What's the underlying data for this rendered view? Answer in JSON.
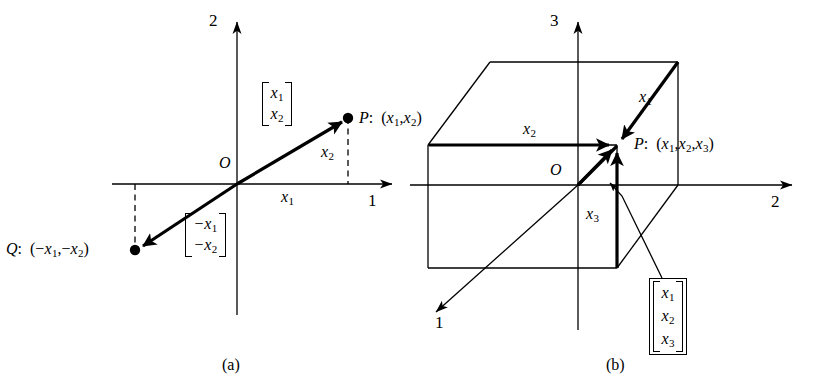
{
  "figure": {
    "type": "diagram",
    "panels": [
      {
        "id": "a",
        "caption": "(a)",
        "dimension": 2,
        "axes": [
          {
            "name": "axis-1",
            "label": "1",
            "direction": "right",
            "component_label": "x1"
          },
          {
            "name": "axis-2",
            "label": "2",
            "direction": "up",
            "component_label": "x2"
          }
        ],
        "origin_label": "O",
        "points": [
          {
            "name": "P",
            "label": "P:  (x₁, x₂)",
            "label_parts": {
              "name": "P",
              "sep": ":",
              "coords": "(x₁, x₂)"
            }
          },
          {
            "name": "Q",
            "label": "Q:  (−x₁, −x₂)",
            "label_parts": {
              "name": "Q",
              "sep": ":",
              "coords": "(−x₁, −x₂)"
            }
          }
        ],
        "component_labels": [
          {
            "name": "x1-extent",
            "base": "x",
            "sub": "1"
          },
          {
            "name": "x2-extent",
            "base": "x",
            "sub": "2"
          }
        ],
        "vectors": [
          {
            "name": "vector-P",
            "rows": [
              {
                "base": "x",
                "sub": "1",
                "sign": ""
              },
              {
                "base": "x",
                "sub": "2",
                "sign": ""
              }
            ]
          },
          {
            "name": "vector-Q",
            "rows": [
              {
                "base": "x",
                "sub": "1",
                "sign": "−"
              },
              {
                "base": "x",
                "sub": "2",
                "sign": "−"
              }
            ]
          }
        ]
      },
      {
        "id": "b",
        "caption": "(b)",
        "dimension": 3,
        "axes": [
          {
            "name": "axis-1",
            "label": "1",
            "direction": "down-left",
            "component_label": "x1"
          },
          {
            "name": "axis-2",
            "label": "2",
            "direction": "right",
            "component_label": "x2"
          },
          {
            "name": "axis-3",
            "label": "3",
            "direction": "up",
            "component_label": "x3"
          }
        ],
        "origin_label": "O",
        "points": [
          {
            "name": "P",
            "label": "P:  (x₁, x₂, x₃)",
            "label_parts": {
              "name": "P",
              "sep": ":",
              "coords": "(x₁, x₂, x₃)"
            }
          }
        ],
        "component_labels": [
          {
            "name": "x1-edge",
            "base": "x",
            "sub": "1"
          },
          {
            "name": "x2-edge",
            "base": "x",
            "sub": "2"
          },
          {
            "name": "x3-edge",
            "base": "x",
            "sub": "3"
          }
        ],
        "vectors": [
          {
            "name": "vector-P",
            "boxed": true,
            "rows": [
              {
                "base": "x",
                "sub": "1",
                "sign": ""
              },
              {
                "base": "x",
                "sub": "2",
                "sign": ""
              },
              {
                "base": "x",
                "sub": "3",
                "sign": ""
              }
            ]
          }
        ]
      }
    ]
  },
  "panel_a": {
    "axis2_label": "2",
    "axis1_label": "1",
    "origin": "O",
    "x1_label": {
      "base": "x",
      "sub": "1"
    },
    "x2_label": {
      "base": "x",
      "sub": "2"
    },
    "p_name": "P",
    "p_colon": ":",
    "p_coords_open": "(",
    "p_c1": {
      "base": "x",
      "sub": "1"
    },
    "p_comma": ",",
    "p_c2": {
      "base": "x",
      "sub": "2"
    },
    "p_coords_close": ")",
    "q_name": "Q",
    "q_colon": ":",
    "q_coords_open": "(",
    "q_c1": {
      "sign": "−",
      "base": "x",
      "sub": "1"
    },
    "q_comma": ",",
    "q_c2": {
      "sign": "−",
      "base": "x",
      "sub": "2"
    },
    "q_coords_close": ")",
    "vec_p_r1": {
      "base": "x",
      "sub": "1"
    },
    "vec_p_r2": {
      "base": "x",
      "sub": "2"
    },
    "vec_q_r1": {
      "sign": "−",
      "base": "x",
      "sub": "1"
    },
    "vec_q_r2": {
      "sign": "−",
      "base": "x",
      "sub": "2"
    },
    "caption": "(a)"
  },
  "panel_b": {
    "axis3_label": "3",
    "axis2_label": "2",
    "axis1_label": "1",
    "origin": "O",
    "x1_label": {
      "base": "x",
      "sub": "1"
    },
    "x2_label": {
      "base": "x",
      "sub": "2"
    },
    "x3_label": {
      "base": "x",
      "sub": "3"
    },
    "p_name": "P",
    "p_colon": ":",
    "p_coords_open": "(",
    "p_c1": {
      "base": "x",
      "sub": "1"
    },
    "p_comma1": ",",
    "p_c2": {
      "base": "x",
      "sub": "2"
    },
    "p_comma2": ",",
    "p_c3": {
      "base": "x",
      "sub": "3"
    },
    "p_coords_close": ")",
    "vec_r1": {
      "base": "x",
      "sub": "1"
    },
    "vec_r2": {
      "base": "x",
      "sub": "2"
    },
    "vec_r3": {
      "base": "x",
      "sub": "3"
    },
    "caption": "(b)"
  },
  "style": {
    "ink": "#000000",
    "background": "#ffffff",
    "thin_stroke": 1.3,
    "thick_stroke": 3.2
  }
}
